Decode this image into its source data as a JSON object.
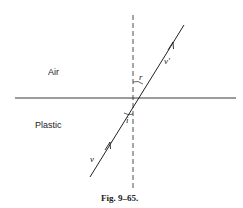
{
  "figure": {
    "caption": "Fig. 9–65.",
    "regions": {
      "upper": "Air",
      "lower": "Plastic"
    },
    "vectors": {
      "incident": "v",
      "refracted": "v'"
    },
    "angles": {
      "incidence": "i",
      "refraction": "r"
    }
  }
}
